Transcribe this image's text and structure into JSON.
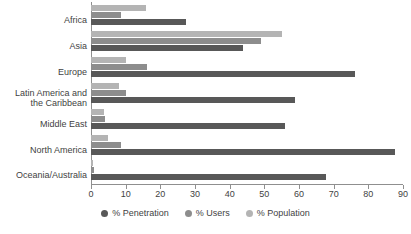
{
  "chart_data": {
    "type": "bar",
    "orientation": "horizontal",
    "title": "",
    "xlabel": "",
    "ylabel": "",
    "xlim": [
      0,
      90
    ],
    "xticks": [
      0,
      10,
      20,
      30,
      40,
      50,
      60,
      70,
      80,
      90
    ],
    "grid": false,
    "legend_position": "bottom-center",
    "categories": [
      "Africa",
      "Asia",
      "Europe",
      "Latin America and\nthe Caribbean",
      "Middle East",
      "North America",
      "Oceania/Australia"
    ],
    "series": [
      {
        "name": "% Penetration",
        "color": "#585858",
        "values": [
          27.4,
          43.9,
          76.1,
          58.9,
          56.1,
          87.7,
          67.8
        ]
      },
      {
        "name": "% Users",
        "color": "#8d8d8d",
        "values": [
          8.7,
          49.0,
          16.2,
          10.1,
          4.0,
          8.7,
          0.8
        ]
      },
      {
        "name": "% Population",
        "color": "#b4b4b4",
        "values": [
          16.0,
          55.0,
          10.1,
          8.1,
          3.7,
          4.9,
          0.5
        ]
      }
    ]
  },
  "legend": {
    "items": [
      {
        "label": "% Penetration",
        "color": "#585858"
      },
      {
        "label": "% Users",
        "color": "#8d8d8d"
      },
      {
        "label": "% Population",
        "color": "#b4b4b4"
      }
    ]
  },
  "axis": {
    "tick_labels": [
      "0",
      "10",
      "20",
      "30",
      "40",
      "50",
      "60",
      "70",
      "80",
      "90"
    ]
  }
}
